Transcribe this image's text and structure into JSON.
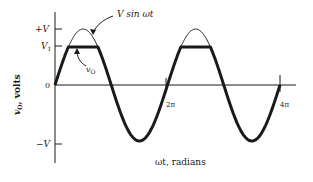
{
  "figure": {
    "y_axis_label": "v",
    "y_axis_label_sub": "O",
    "y_axis_label_unit": ", volts",
    "x_axis_label": "ωt, radians",
    "ticks_y": {
      "plus_v": "+V",
      "v1": "V",
      "v1_sub": "1",
      "zero": "0",
      "minus_v": "−V"
    },
    "ticks_x": {
      "two_pi": "2π",
      "four_pi": "4π"
    },
    "curve_labels": {
      "input": "V sin ωt",
      "output": "v",
      "output_sub": "O"
    }
  },
  "colors": {
    "ink": "#1a1a1a",
    "background": "#ffffff"
  },
  "geometry": {
    "origin_x": 55,
    "zero_y": 85,
    "period_px": 112.5,
    "amplitude_px": 56,
    "clip_y": 47
  }
}
